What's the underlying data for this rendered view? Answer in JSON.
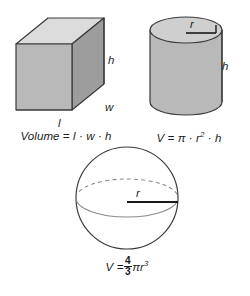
{
  "page": {
    "background_color": "#ffffff",
    "ink_color": "#1a1a1a"
  },
  "palette": {
    "face_top": "#dcdcdc",
    "face_front": "#b9b9b9",
    "face_side": "#9d9d9d",
    "cylinder_top": "#cfcfcf",
    "cylinder_body": "#b9b9b9",
    "sphere_fill": "#ffffff",
    "outline": "#3a3a3a",
    "hidden_line": "#8a8a8a"
  },
  "figures": [
    {
      "id": "cube",
      "name": "rectangular-prism",
      "shape_label": "Rectangular prism (box)",
      "dimension_labels": {
        "height": "h",
        "width": "w",
        "length": "l"
      },
      "formula": {
        "lhs": "Volume",
        "equals": "=",
        "terms": [
          "l",
          "w",
          "h"
        ],
        "operator": "·",
        "plain": "Volume = l · w · h"
      }
    },
    {
      "id": "cylinder",
      "name": "cylinder",
      "shape_label": "Cylinder",
      "dimension_labels": {
        "height": "h",
        "radius": "r"
      },
      "formula": {
        "lhs": "V",
        "equals": "=",
        "pi": "π",
        "radius_var": "r",
        "radius_exponent": "2",
        "height_var": "h",
        "operator": "·",
        "plain": "V = π · r2 · h"
      }
    },
    {
      "id": "sphere",
      "name": "sphere",
      "shape_label": "Sphere",
      "dimension_labels": {
        "radius": "r"
      },
      "formula": {
        "lhs": "V",
        "equals": "=",
        "fraction_numerator": "4",
        "fraction_denominator": "3",
        "pi": "π",
        "radius_var": "r",
        "radius_exponent": "3",
        "plain": "V = 4/3 π r3"
      }
    }
  ]
}
